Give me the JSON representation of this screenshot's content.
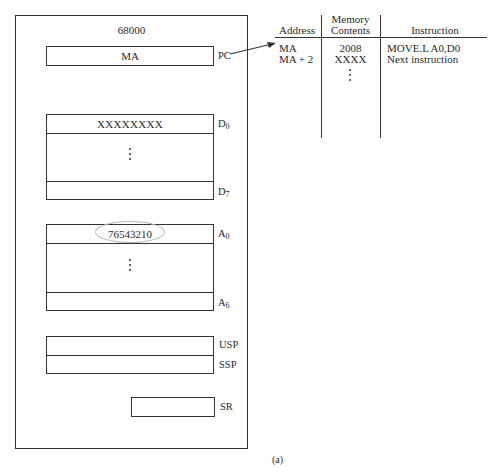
{
  "cpu": {
    "title": "68000",
    "pc": {
      "value": "MA",
      "label": "PC"
    },
    "data_registers": {
      "first": {
        "value": "XXXXXXXX",
        "label": "D",
        "sub": "0"
      },
      "last": {
        "value": "",
        "label": "D",
        "sub": "7"
      }
    },
    "address_registers": {
      "first": {
        "value": "76543210",
        "label": "A",
        "sub": "0",
        "highlighted": true
      },
      "last": {
        "value": "",
        "label": "A",
        "sub": "6"
      }
    },
    "stack_pointers": [
      {
        "value": "",
        "label": "USP"
      },
      {
        "value": "",
        "label": "SSP"
      }
    ],
    "status_register": {
      "value": "",
      "label": "SR"
    }
  },
  "memory_table": {
    "headers": {
      "address": "Address",
      "contents_line1": "Memory",
      "contents_line2": "Contents",
      "instruction": "Instruction"
    },
    "rows": [
      {
        "address": "MA",
        "contents": "2008",
        "instruction": "MOVE.L A0,D0"
      },
      {
        "address": "MA + 2",
        "contents": "XXXX",
        "instruction": "Next instruction"
      }
    ]
  },
  "arrow": {
    "from": "PC",
    "to": "MA"
  },
  "caption": "(a)"
}
